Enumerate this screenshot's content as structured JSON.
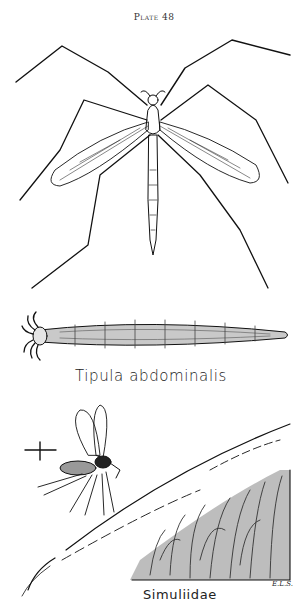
{
  "plate": {
    "title": "Plate 48"
  },
  "figures": [
    {
      "name": "adult-crane-fly",
      "caption": ""
    },
    {
      "name": "crane-fly-larva",
      "caption": "Tipula abdominalis"
    },
    {
      "name": "black-fly-and-larvae",
      "caption": "Simuliidae",
      "scale_marker": "+"
    }
  ],
  "artist_initials": "E.L.S."
}
